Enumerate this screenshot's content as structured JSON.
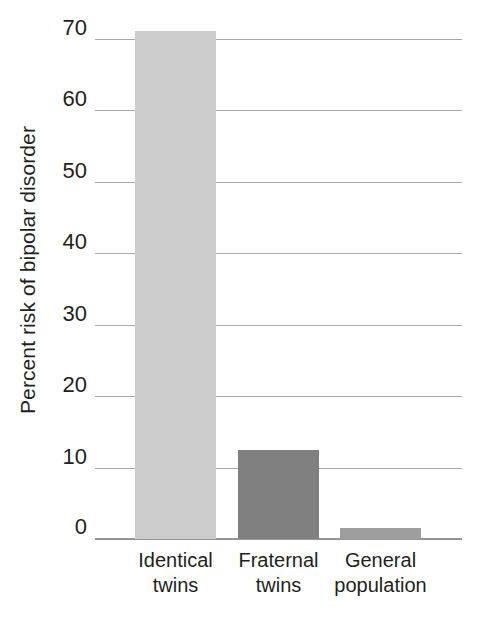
{
  "chart_data": {
    "type": "bar",
    "title": "",
    "xlabel": "",
    "ylabel": "Percent risk of bipolar disorder",
    "categories": [
      "Identical twins",
      "Fraternal twins",
      "General population"
    ],
    "category_lines": [
      [
        "Identical",
        "twins"
      ],
      [
        "Fraternal",
        "twins"
      ],
      [
        "General",
        "population"
      ]
    ],
    "values": [
      71,
      12.5,
      1.5
    ],
    "ylim": [
      0,
      70
    ],
    "yticks": [
      0,
      10,
      20,
      30,
      40,
      50,
      60,
      70
    ],
    "ytick_labels": [
      "0",
      "10",
      "20",
      "30",
      "40",
      "50",
      "60",
      "70"
    ],
    "grid": true,
    "legend": "none",
    "bar_colors": [
      "#cccccc",
      "#808080",
      "#9e9e9e"
    ],
    "gridline_color": "#a8a9ad",
    "axis_color": "#939598",
    "text_color": "#231f20"
  }
}
